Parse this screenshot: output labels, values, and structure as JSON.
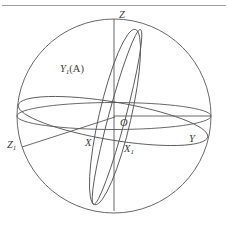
{
  "figure": {
    "background_color": "#ffffff",
    "line_color": "#5a5a5a",
    "label_color": "#3b3b3b",
    "top_rule": {
      "present": true,
      "color": "#9a9a9a"
    }
  },
  "labels": {
    "z_axis": "Z",
    "y1_a": "Y",
    "y1_a_sub": "1",
    "y1_a_paren": "(A)",
    "z1": "Z",
    "z1_sub": "1",
    "x_axis": "X",
    "origin": "O",
    "x1": "X",
    "x1_sub": "1",
    "y_axis": "Y"
  },
  "geometry": {
    "sphere": {
      "cx": 114,
      "cy": 116,
      "r": 97
    },
    "equatorial_ellipse": {
      "cx": 114,
      "cy": 116,
      "rx": 97,
      "ry": 14
    },
    "tilted_ellipse_a": {
      "cx": 114,
      "cy": 118,
      "rx": 15,
      "ry": 91,
      "rotation_deg": 12
    },
    "tilted_ellipse_b": {
      "cx": 116,
      "cy": 117,
      "rx": 10,
      "ry": 91,
      "rotation_deg": 14
    },
    "inclined_ellipse_z1": {
      "cx": 112,
      "cy": 122,
      "rx": 96,
      "ry": 20,
      "rotation_deg": 9
    },
    "axis_z": {
      "x1": 114,
      "y1": 19,
      "x2": 114,
      "y2": 211
    },
    "axis_y": {
      "x1": 114,
      "y1": 116,
      "x2": 211,
      "y2": 116
    },
    "axis_z1": {
      "x1": 114,
      "y1": 117,
      "x2": 22,
      "y2": 147
    }
  }
}
